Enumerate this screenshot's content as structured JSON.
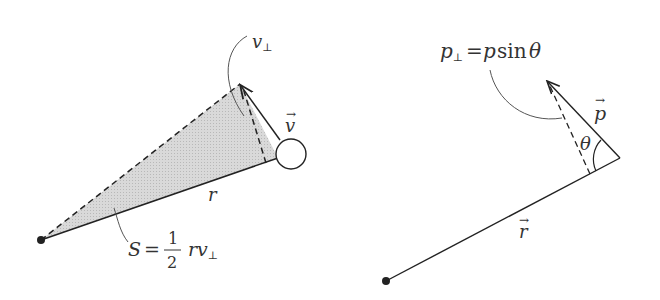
{
  "left_panel": {
    "label_v_perp": "v",
    "label_v_perp_sub": "⊥",
    "label_v_vec": "v",
    "label_r": "r",
    "area_formula": {
      "lhs": "S",
      "eq": "=",
      "num": "1",
      "den": "2",
      "rhs": "rv",
      "rhs_sub": "⊥"
    },
    "colors": {
      "shade": "#d4d4d4",
      "line": "#222222"
    }
  },
  "right_panel": {
    "formula": {
      "lhs": "p",
      "lhs_sub": "⊥",
      "eq": "=",
      "rhs_p": "p",
      "rhs_sin": "sin",
      "rhs_theta": "θ"
    },
    "label_p_vec": "p",
    "label_theta": "θ",
    "label_r_vec": "r"
  }
}
